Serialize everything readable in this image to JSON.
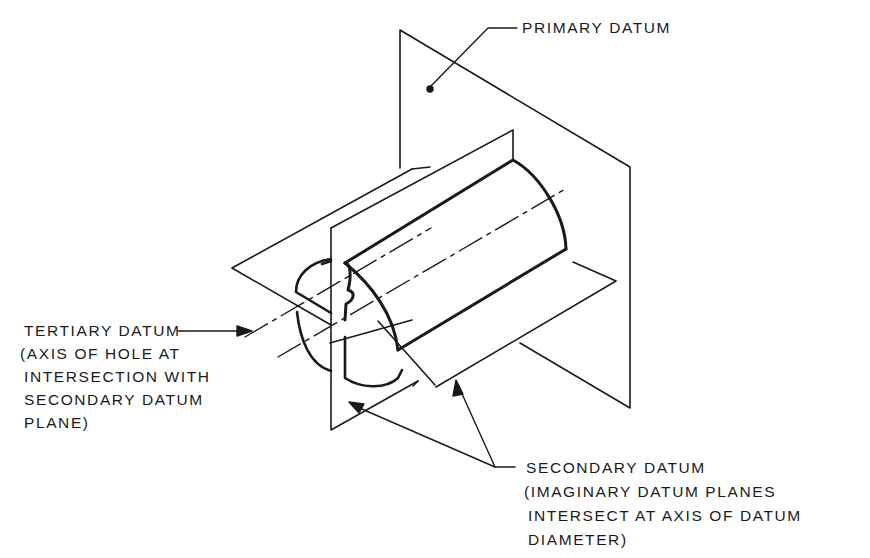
{
  "diagram": {
    "type": "isometric datum reference frame drawing",
    "labels": {
      "primary": "PRIMARY DATUM",
      "tertiary": {
        "line1": "TERTIARY DATUM",
        "line2": "(AXIS OF HOLE AT",
        "line3": "INTERSECTION WITH",
        "line4": "SECONDARY DATUM",
        "line5": "PLANE)"
      },
      "secondary": {
        "line1": "SECONDARY DATUM",
        "line2": "(IMAGINARY DATUM PLANES",
        "line3": "INTERSECT AT AXIS OF DATUM",
        "line4": "DIAMETER)"
      }
    },
    "colors": {
      "line": "#1a1a1a",
      "background": "#ffffff"
    }
  }
}
